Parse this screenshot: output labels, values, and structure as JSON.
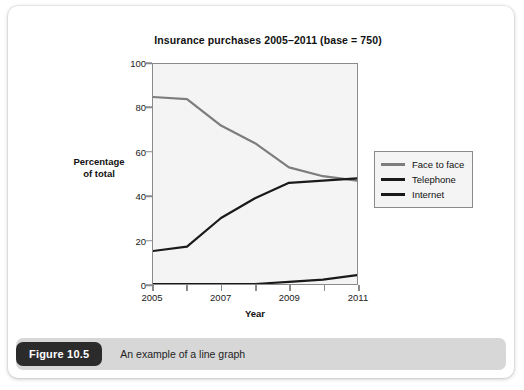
{
  "figure": {
    "badge_label": "Figure 10.5",
    "caption": "An example of a line graph"
  },
  "chart_data": {
    "type": "line",
    "title": "Insurance purchases 2005–2011 (base = 750)",
    "xlabel": "Year",
    "ylabel": "Percentage\nof total",
    "ylabel_line1": "Percentage",
    "ylabel_line2": "of total",
    "x": [
      2005,
      2006,
      2007,
      2008,
      2009,
      2010,
      2011
    ],
    "categories": [
      "2005",
      "2006",
      "2007",
      "2008",
      "2009",
      "2010",
      "2011"
    ],
    "xtick_labels": [
      "2005",
      "2007",
      "2009",
      "2011"
    ],
    "xticks": [
      2005,
      2007,
      2009,
      2011
    ],
    "ytick_labels": [
      "0",
      "20",
      "40",
      "60",
      "80",
      "100"
    ],
    "yticks": [
      0,
      20,
      40,
      60,
      80,
      100
    ],
    "xlim": [
      2005,
      2011
    ],
    "ylim": [
      0,
      100
    ],
    "grid": false,
    "legend_position": "right",
    "series": [
      {
        "name": "Face to face",
        "color": "#7d7d7d",
        "values": [
          85,
          84,
          72,
          64,
          53,
          49,
          47
        ]
      },
      {
        "name": "Telephone",
        "color": "#1a1a1a",
        "values": [
          15,
          17,
          30,
          39,
          46,
          47,
          48
        ]
      },
      {
        "name": "Internet",
        "color": "#1a1a1a",
        "values": [
          0,
          0,
          0,
          0,
          1,
          2,
          4
        ]
      }
    ]
  }
}
